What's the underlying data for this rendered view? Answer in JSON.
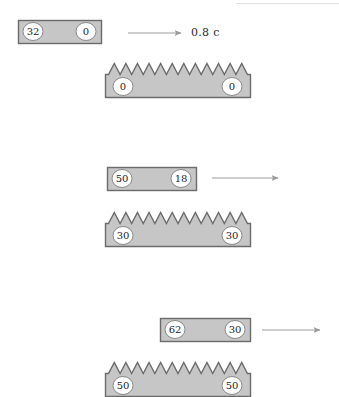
{
  "figure": {
    "title_text": "",
    "background_color": "#ffffff",
    "body_fill": "#c6c6c6",
    "body_stroke": "#6b6b6b",
    "clock_face_fill": "#ffffff",
    "clock_face_stroke": "#8a8a8a",
    "arrow_color": "#9a9a9a",
    "label_color": "#2b2b2b",
    "canvas": {
      "width": 339,
      "height": 397
    }
  },
  "speed_label": {
    "text": "0.8 c",
    "x": 191,
    "y": 26
  },
  "arrows": [
    {
      "name": "arrow-row-1",
      "x1": 128,
      "y1": 33,
      "x2": 181,
      "y2": 33
    },
    {
      "name": "arrow-row-2",
      "x1": 212,
      "y1": 178,
      "x2": 278,
      "y2": 178
    },
    {
      "name": "arrow-row-3",
      "x1": 262,
      "y1": 330,
      "x2": 320,
      "y2": 330
    }
  ],
  "rods": [
    {
      "name": "moving-rod-1",
      "x": 18,
      "y": 20,
      "width": 83,
      "height": 23,
      "left_clock": "32",
      "right_clock": "0"
    },
    {
      "name": "moving-rod-2",
      "x": 107,
      "y": 167,
      "width": 89,
      "height": 23,
      "left_clock": "50",
      "right_clock": "18"
    },
    {
      "name": "moving-rod-3",
      "x": 160,
      "y": 318,
      "width": 90,
      "height": 23,
      "left_clock": "62",
      "right_clock": "30"
    }
  ],
  "combs": [
    {
      "name": "lattice-comb-1",
      "x": 105,
      "y": 63,
      "width": 145,
      "height": 34,
      "teeth": 12,
      "tooth_depth": 11,
      "left_clock": "0",
      "right_clock": "0"
    },
    {
      "name": "lattice-comb-2",
      "x": 105,
      "y": 212,
      "width": 145,
      "height": 34,
      "teeth": 12,
      "tooth_depth": 11,
      "left_clock": "30",
      "right_clock": "30"
    },
    {
      "name": "lattice-comb-3",
      "x": 105,
      "y": 362,
      "width": 145,
      "height": 34,
      "teeth": 12,
      "tooth_depth": 11,
      "left_clock": "50",
      "right_clock": "50"
    }
  ],
  "clock_geometry": {
    "rx": 10,
    "ry": 9,
    "font_size": 10,
    "inset_x": 15,
    "comb_inset_x": 18
  }
}
